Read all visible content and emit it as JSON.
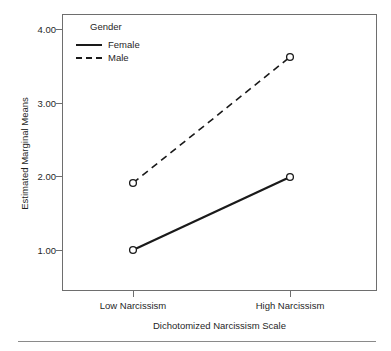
{
  "chart_data": {
    "type": "line",
    "title": "",
    "xlabel": "Dichotomized Narcissism Scale",
    "ylabel": "Estimated Marginal Means",
    "categories": [
      "Low Narcissism",
      "High Narcissism"
    ],
    "ylim": [
      0.55,
      4.22
    ],
    "yticks": [
      1.0,
      2.0,
      3.0,
      4.0
    ],
    "ytick_labels": [
      "1.00",
      "2.00",
      "3.00",
      "4.00"
    ],
    "grid": false,
    "legend_position": "top-left",
    "legend_title": "Gender",
    "marker": "open-circle",
    "series": [
      {
        "name": "Female",
        "values": [
          1.0,
          1.99
        ],
        "line_style": "solid",
        "color": "#1a1a1a"
      },
      {
        "name": "Male",
        "values": [
          1.91,
          3.62
        ],
        "line_style": "dashed",
        "color": "#1a1a1a"
      }
    ]
  },
  "axes": {
    "y": {
      "label": "Estimated Marginal Means",
      "ticks": [
        {
          "label": "4.00"
        },
        {
          "label": "3.00"
        },
        {
          "label": "2.00"
        },
        {
          "label": "1.00"
        }
      ]
    },
    "x": {
      "label": "Dichotomized Narcissism Scale",
      "ticks": [
        {
          "label": "Low Narcissism"
        },
        {
          "label": "High Narcissism"
        }
      ]
    }
  },
  "legend": {
    "title": "Gender",
    "entries": [
      {
        "label": "Female",
        "style": "solid"
      },
      {
        "label": "Male",
        "style": "dashed"
      }
    ]
  },
  "colors": {
    "line": "#1a1a1a",
    "frame": "#6e6e6e",
    "text": "#1f1f1f",
    "rule": "#8a8a8a",
    "background": "#ffffff"
  }
}
